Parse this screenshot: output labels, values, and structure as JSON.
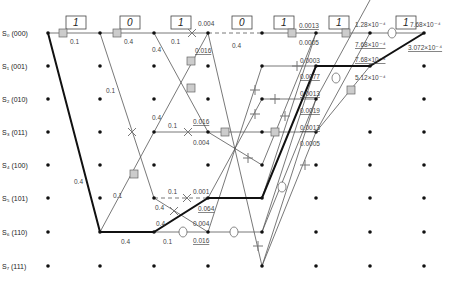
{
  "colors": {
    "path": "#555555",
    "survivor": "#111111",
    "marker": "#cccccc",
    "node": "#111111"
  },
  "states": [
    {
      "label": "S₀ (000)"
    },
    {
      "label": "S₁ (001)"
    },
    {
      "label": "S₂ (010)"
    },
    {
      "label": "S₃ (011)"
    },
    {
      "label": "S₄ (100)"
    },
    {
      "label": "S₅ (101)"
    },
    {
      "label": "S₆ (110)"
    },
    {
      "label": "S₇ (111)"
    }
  ],
  "input_bits": [
    "1",
    "0",
    "1",
    "0",
    "1",
    "1",
    "1"
  ],
  "metrics": {
    "m1": "0.1",
    "m2": "0.4",
    "m3": "0.4",
    "m4": "0.1",
    "m5": "0.004",
    "m6": "0.4",
    "m7": "0.016",
    "m8": "0.1",
    "m9": "0.4",
    "m10": "0.1",
    "m11": "0.016",
    "m12": "0.004",
    "m13": "0.4",
    "m14": "0.1",
    "m15": "0.1",
    "m16": "0.001",
    "m17": "0.4",
    "m18": "0.064",
    "m19": "0.4",
    "m20": "0.004",
    "m21": "0.4",
    "m22": "0.1",
    "m23": "0.016",
    "m24": "0.0013",
    "m25": "0.0005",
    "m26": "0.0003",
    "m27": "0.0077",
    "m28": "0.0013",
    "m29": "0.0019",
    "m30": "0.0013",
    "m31": "0.0005",
    "m32": "1.28×10⁻⁴",
    "m33": "7.68×10⁻⁴",
    "m34": "7.68×10⁻⁴",
    "m35": "5.12×10⁻⁴",
    "m36": "7.68×10⁻⁴",
    "m37": "3.072×10⁻⁴"
  }
}
